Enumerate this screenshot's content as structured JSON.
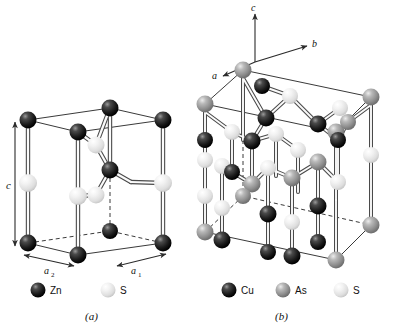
{
  "figure": {
    "background_color": "#ffffff",
    "panels": [
      {
        "id": "a",
        "caption": "(a)",
        "compound": "ZnS (wurtzite)",
        "axis_labels": [
          {
            "name": "c",
            "text": "c"
          },
          {
            "name": "a2",
            "text": "a",
            "sub": "2"
          },
          {
            "name": "a1",
            "text": "a",
            "sub": "1"
          }
        ],
        "legend": [
          {
            "label": "Zn",
            "color": "#1c1c1c",
            "highlight": "#8d8d8d"
          },
          {
            "label": "S",
            "color": "#e8e8e8",
            "highlight": "#ffffff"
          }
        ]
      },
      {
        "id": "b",
        "caption": "(b)",
        "compound": "Cu3AsS4 (enargite)",
        "axis_labels": [
          {
            "name": "c",
            "text": "c"
          },
          {
            "name": "b",
            "text": "b"
          },
          {
            "name": "a",
            "text": "a"
          }
        ],
        "legend": [
          {
            "label": "Cu",
            "color": "#1c1c1c",
            "highlight": "#8d8d8d"
          },
          {
            "label": "As",
            "color": "#9a9a9a",
            "highlight": "#d8d8d8"
          },
          {
            "label": "S",
            "color": "#e8e8e8",
            "highlight": "#ffffff"
          }
        ]
      }
    ],
    "colors": {
      "dark_atom": "#1c1c1c",
      "mid_atom": "#9a9a9a",
      "light_atom": "#e8e8e8",
      "cell_edge": "#3a3a3a",
      "bond_outline": "#4a4a4a",
      "bond_core": "#fbfbfb",
      "axis_arrow": "#2b2b2b"
    }
  }
}
